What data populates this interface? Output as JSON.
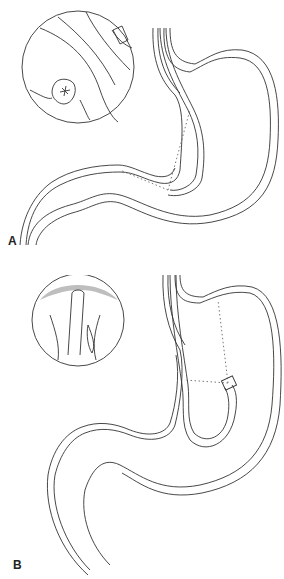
{
  "figure": {
    "type": "medical-illustration",
    "line_color": "#333333",
    "background": "#ffffff"
  },
  "panels": [
    {
      "label": "A",
      "description": "Endoscope in stomach directed toward pylorus; inset circle shows endoscopic view of antrum with pyloric opening"
    },
    {
      "label": "B",
      "description": "Endoscope retroflexed (J-maneuver) viewing the cardia; inset circle shows endoscope shaft entering through the gastroesophageal junction"
    }
  ]
}
